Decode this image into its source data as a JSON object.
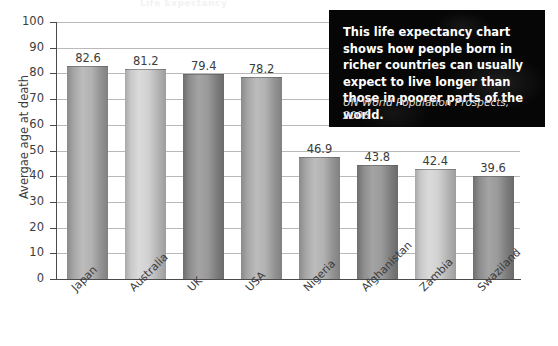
{
  "ghost_title": "Life Expectancy",
  "note": {
    "body": "This life expectancy chart shows how people born in richer countries can usually expect to live longer than those in poorer parts of the world.",
    "source": "UN World Population Prospects, 2006"
  },
  "chart_data": {
    "type": "bar",
    "title": "",
    "xlabel": "",
    "ylabel": "Avergae age at death",
    "ylim": [
      0,
      100
    ],
    "ytick_step": 10,
    "grid": true,
    "legend": "none",
    "categories": [
      "Japan",
      "Australia",
      "UK",
      "USA",
      "Nigeria",
      "Afghanistan",
      "Zambia",
      "Swaziland"
    ],
    "values": [
      82.6,
      81.2,
      79.4,
      78.2,
      46.9,
      43.8,
      42.4,
      39.6
    ],
    "value_labels": [
      "82.6",
      "81.2",
      "79.4",
      "78.2",
      "46.9",
      "43.8",
      "42.4",
      "39.6"
    ],
    "ytick_labels": [
      "100",
      "90",
      "80",
      "70",
      "60",
      "50",
      "40",
      "30",
      "20",
      "10",
      "0"
    ],
    "bar_shades": [
      "mid",
      "light",
      "dark",
      "mid",
      "mid",
      "dark",
      "light",
      "dark"
    ],
    "colors": {
      "bar_light": "#d2d2d2",
      "bar_mid": "#9a9a9a",
      "bar_dark": "#7d7d7d",
      "grid": "#b9b9b9",
      "axis": "#4a4a4a",
      "text": "#3c3c3c",
      "note_background": "#060606",
      "note_text": "#ffffff"
    }
  }
}
